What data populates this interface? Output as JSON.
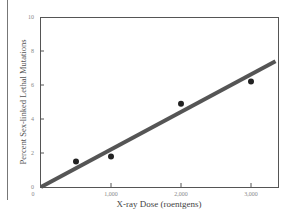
{
  "chart_data": {
    "type": "scatter",
    "title": "",
    "xlabel": "X-ray Dose (roentgens)",
    "ylabel": "Percent Sex-linked Lethal Mutations",
    "xlim": [
      0,
      3400
    ],
    "ylim": [
      0,
      10
    ],
    "x_ticks": [
      0,
      1000,
      2000,
      3000
    ],
    "x_tick_labels": [
      "0",
      "1,000",
      "2,000",
      "3,000"
    ],
    "y_ticks": [
      0,
      2,
      4,
      6,
      8,
      10
    ],
    "y_tick_labels": [
      "0",
      "2",
      "4",
      "6",
      "8",
      "10"
    ],
    "grid": false,
    "legend": null,
    "series": [
      {
        "name": "Observed data",
        "type": "scatter",
        "x": [
          500,
          1000,
          2000,
          3000
        ],
        "y": [
          1.5,
          1.8,
          4.9,
          6.2
        ]
      },
      {
        "name": "Linear fit",
        "type": "line",
        "x": [
          0,
          3350
        ],
        "y": [
          0,
          7.4
        ]
      }
    ]
  },
  "labels": {
    "x_axis_title": "X-ray Dose (roentgens)",
    "y_axis_title": "Percent Sex-linked Lethal Mutations"
  },
  "colors": {
    "line": "#555555",
    "points": "#222222",
    "frame": "#555555"
  }
}
